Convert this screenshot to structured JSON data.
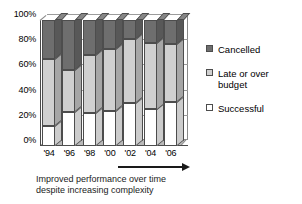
{
  "chart_data": {
    "type": "bar",
    "stacked": true,
    "stack_mode": "percent",
    "title": "",
    "subtitle": "",
    "xlabel": "",
    "ylabel": "",
    "ylim": [
      0,
      100
    ],
    "grid": true,
    "legend_position": "right",
    "categories": [
      "'94",
      "'96",
      "'98",
      "'00",
      "'02",
      "'04",
      "'06"
    ],
    "ytick_labels": [
      "0%",
      "20%",
      "40%",
      "60%",
      "80%",
      "100%"
    ],
    "ytick_values": [
      0,
      20,
      40,
      60,
      80,
      100
    ],
    "series": [
      {
        "name": "Successful",
        "color": "#ffffff",
        "values": [
          16,
          27,
          26,
          28,
          34,
          29,
          35
        ]
      },
      {
        "name": "Late or over budget",
        "color": "#d0d0d0",
        "values": [
          53,
          33,
          46,
          49,
          51,
          53,
          46
        ]
      },
      {
        "name": "Cancelled",
        "color": "#6e6e6e",
        "values": [
          31,
          40,
          28,
          23,
          15,
          18,
          19
        ]
      }
    ],
    "legend": [
      {
        "label": "Cancelled",
        "color": "#6e6e6e"
      },
      {
        "label": "Late or over budget",
        "color": "#d0d0d0"
      },
      {
        "label": "Successful",
        "color": "#ffffff"
      }
    ],
    "annotations": [
      {
        "name": "trend-arrow",
        "type": "arrow",
        "direction": "right",
        "label": ""
      },
      {
        "name": "caption",
        "type": "text",
        "label": "Improved performance over time despite increasing complexity"
      }
    ]
  },
  "caption": {
    "line1": "Improved performance over time",
    "line2": "despite increasing complexity"
  }
}
